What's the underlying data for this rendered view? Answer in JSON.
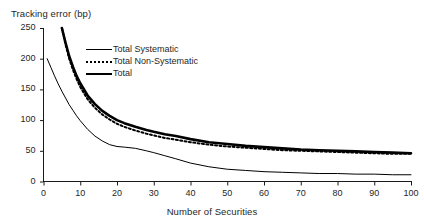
{
  "chart_data": {
    "type": "line",
    "title": "",
    "xlabel": "Number of Securities",
    "ylabel": "Tracking error (bp)",
    "xlim": [
      0,
      100
    ],
    "ylim": [
      0,
      250
    ],
    "xticks": [
      0,
      10,
      20,
      30,
      40,
      50,
      60,
      70,
      80,
      90,
      100
    ],
    "yticks": [
      0,
      50,
      100,
      150,
      200,
      250
    ],
    "grid": false,
    "legend_position": "upper-center",
    "series": [
      {
        "name": "Total Systematic",
        "style": "thin-solid",
        "color": "#000000",
        "x": [
          1,
          2,
          3,
          4,
          5,
          6,
          7,
          8,
          9,
          10,
          12,
          14,
          16,
          18,
          20,
          22,
          25,
          28,
          30,
          33,
          36,
          40,
          45,
          50,
          55,
          60,
          65,
          70,
          75,
          80,
          85,
          90,
          95,
          100
        ],
        "y": [
          200,
          186,
          172,
          159,
          147,
          136,
          125,
          116,
          107,
          99,
          85,
          74,
          66,
          60,
          57,
          56,
          54,
          50,
          47,
          42,
          37,
          30,
          24,
          20,
          18,
          16,
          15,
          14,
          13,
          13,
          12,
          12,
          11,
          11
        ]
      },
      {
        "name": "Total Non-Systematic",
        "style": "dotted",
        "color": "#000000",
        "x": [
          5,
          6,
          7,
          8,
          9,
          10,
          12,
          14,
          16,
          18,
          20,
          22,
          25,
          28,
          30,
          33,
          36,
          40,
          45,
          50,
          55,
          60,
          65,
          70,
          75,
          80,
          85,
          90,
          95,
          100
        ],
        "y": [
          250,
          223,
          200,
          182,
          167,
          154,
          134,
          120,
          109,
          101,
          94,
          89,
          83,
          78,
          75,
          71,
          68,
          64,
          60,
          57,
          55,
          53,
          51,
          50,
          49,
          48,
          47,
          46,
          45,
          45
        ]
      },
      {
        "name": "Total",
        "style": "thick-solid",
        "color": "#000000",
        "x": [
          5,
          6,
          7,
          8,
          9,
          10,
          12,
          14,
          16,
          18,
          20,
          22,
          25,
          28,
          30,
          33,
          36,
          40,
          45,
          50,
          55,
          60,
          65,
          70,
          75,
          80,
          85,
          90,
          95,
          100
        ],
        "y": [
          250,
          226,
          204,
          187,
          172,
          160,
          140,
          126,
          115,
          107,
          100,
          95,
          89,
          84,
          81,
          77,
          74,
          69,
          64,
          61,
          58,
          56,
          54,
          52,
          51,
          50,
          49,
          48,
          47,
          46
        ]
      }
    ]
  },
  "legend": {
    "items": [
      {
        "label": "Total Systematic",
        "swatch": "thin-solid-line-swatch"
      },
      {
        "label": "Total Non-Systematic",
        "swatch": "dotted-line-swatch"
      },
      {
        "label": "Total",
        "swatch": "thick-solid-line-swatch"
      }
    ]
  },
  "ytick_labels": [
    "250",
    "200",
    "150",
    "100",
    "50",
    "0"
  ],
  "xtick_labels": [
    "0",
    "10",
    "20",
    "30",
    "40",
    "50",
    "60",
    "70",
    "80",
    "90",
    "100"
  ]
}
